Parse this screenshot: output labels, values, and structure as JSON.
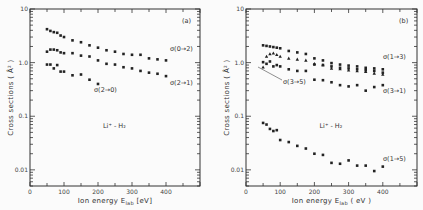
{
  "chart_data": [
    {
      "type": "scatter",
      "panel": "(a)",
      "title": "",
      "annotation": "Li+ - H2",
      "xlabel": "Ion energy E_lab (eV)",
      "ylabel": "Cross sections ( Å² )",
      "xlim": [
        0,
        500
      ],
      "ylim": [
        0.005,
        10
      ],
      "yscale": "log",
      "xticks": [
        0,
        100,
        200,
        300,
        400
      ],
      "yticks": [
        "0.01",
        "0.1",
        "1.0",
        "10"
      ],
      "series": [
        {
          "name": "σ(0→2)",
          "marker": "circle",
          "x": [
            50,
            60,
            70,
            80,
            90,
            100,
            125,
            150,
            175,
            200,
            225,
            250,
            275,
            300,
            325,
            350,
            375,
            400
          ],
          "y": [
            4.2,
            3.9,
            3.7,
            3.6,
            3.2,
            3.0,
            2.6,
            2.4,
            2.1,
            1.9,
            1.7,
            1.6,
            1.45,
            1.4,
            1.4,
            1.2,
            1.15,
            1.1
          ]
        },
        {
          "name": "σ(2→1)",
          "marker": "circle",
          "x": [
            50,
            60,
            70,
            80,
            90,
            100,
            125,
            150,
            175,
            200,
            225,
            250,
            275,
            300,
            325,
            350,
            375,
            400
          ],
          "y": [
            1.6,
            1.75,
            1.75,
            1.7,
            1.55,
            1.5,
            1.5,
            1.35,
            1.3,
            1.1,
            0.95,
            0.92,
            0.82,
            0.78,
            0.7,
            0.65,
            0.62,
            0.56
          ]
        },
        {
          "name": "σ(2→0)",
          "marker": "circle",
          "x": [
            50,
            60,
            70,
            80,
            90,
            100,
            125,
            150,
            175,
            200
          ],
          "y": [
            0.92,
            0.92,
            0.78,
            0.9,
            0.68,
            0.68,
            0.58,
            0.6,
            0.48,
            0.4
          ]
        }
      ]
    },
    {
      "type": "scatter",
      "panel": "(b)",
      "title": "",
      "annotation": "Li+ - H2",
      "xlabel": "Ion energy E_lab (eV)",
      "ylabel": "Cross sections ( Å² )",
      "xlim": [
        0,
        500
      ],
      "ylim": [
        0.005,
        10
      ],
      "yscale": "log",
      "xticks": [
        0,
        100,
        200,
        300,
        400
      ],
      "yticks": [
        "0.01",
        "0.1",
        "1.0",
        "10"
      ],
      "series": [
        {
          "name": "σ(1→3)",
          "marker": "circle",
          "x": [
            50,
            60,
            70,
            80,
            90,
            100,
            125,
            150,
            175,
            200,
            225,
            250,
            275,
            300,
            325,
            350,
            375,
            400
          ],
          "y": [
            2.1,
            2.05,
            2.0,
            1.95,
            1.9,
            1.85,
            1.65,
            1.55,
            1.45,
            1.2,
            1.1,
            0.98,
            0.92,
            0.88,
            0.85,
            0.8,
            0.78,
            0.75
          ]
        },
        {
          "name": "σ(1→3) triangles",
          "marker": "triangle",
          "x": [
            50,
            60,
            70,
            80,
            90,
            100,
            125,
            150,
            175,
            200,
            225,
            250,
            275,
            300,
            325,
            350,
            375,
            400
          ],
          "y": [
            0.82,
            1.3,
            1.45,
            1.5,
            1.4,
            1.3,
            1.2,
            1.15,
            1.1,
            0.95,
            0.9,
            0.78,
            0.76,
            0.72,
            0.7,
            0.68,
            0.63,
            0.6
          ]
        },
        {
          "name": "σ(3→5)",
          "marker": "circle",
          "x": [
            50,
            60,
            70,
            80,
            90,
            100,
            125,
            150,
            175,
            200,
            225,
            250,
            275,
            300,
            325,
            350,
            375,
            400
          ],
          "y": [
            1.02,
            0.95,
            1.05,
            0.85,
            0.9,
            0.85,
            0.75,
            0.7,
            0.7,
            0.92,
            0.9,
            0.85,
            0.8,
            0.78,
            0.75,
            0.72,
            0.7,
            0.65
          ]
        },
        {
          "name": "σ(3→1)",
          "marker": "circle",
          "x": [
            200,
            225,
            250,
            275,
            300,
            325,
            350,
            375,
            400
          ],
          "y": [
            0.48,
            0.47,
            0.43,
            0.38,
            0.36,
            0.38,
            0.3,
            0.35,
            0.38
          ]
        },
        {
          "name": "σ(1→5)",
          "marker": "circle",
          "x": [
            50,
            60,
            70,
            80,
            90,
            100,
            125,
            150,
            175,
            200,
            225,
            250,
            275,
            300,
            325,
            350,
            375,
            400
          ],
          "y": [
            0.075,
            0.07,
            0.058,
            0.053,
            0.055,
            0.036,
            0.033,
            0.028,
            0.025,
            0.02,
            0.019,
            0.0135,
            0.013,
            0.015,
            0.012,
            0.012,
            0.0095,
            0.0115
          ]
        }
      ]
    }
  ],
  "panels": [
    {
      "tag": "(a)",
      "annotation": "Li⁺ - H₂",
      "xlabel": "Ion energy  E",
      "xlabel_sub": "lab",
      "xlabel_unit": " [eV]",
      "ylabel": "Cross sections ( Å² )",
      "labels": [
        {
          "text": "σ(0→2)",
          "x": 170,
          "y": 51
        },
        {
          "text": "σ(2→1)",
          "x": 170,
          "y": 85
        },
        {
          "text": "σ(2→0)",
          "x": 94,
          "y": 92
        }
      ]
    },
    {
      "tag": "(b)",
      "annotation": "Li⁺ - H₂",
      "xlabel": "Ion energy  E",
      "xlabel_sub": "lab",
      "xlabel_unit": " ( eV )",
      "ylabel": "Cross sections ( Å² )",
      "labels": [
        {
          "text": "σ(1→3)",
          "x": 383,
          "y": 59
        },
        {
          "text": "σ(3→5)",
          "x": 283,
          "y": 84
        },
        {
          "text": "σ(3→1)",
          "x": 383,
          "y": 93
        },
        {
          "text": "σ(1→5)",
          "x": 383,
          "y": 161
        }
      ]
    }
  ]
}
